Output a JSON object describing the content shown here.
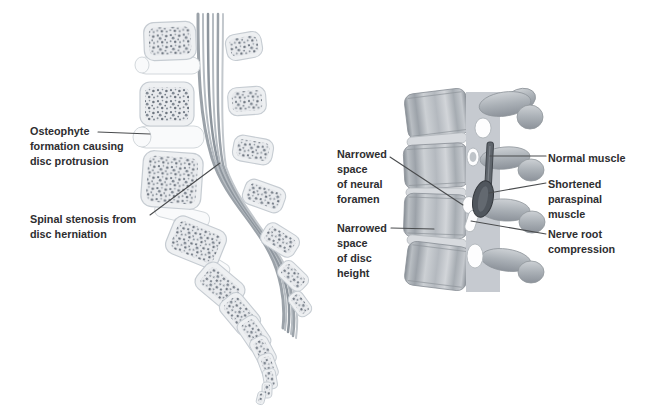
{
  "figure": {
    "labels": {
      "osteophyte": {
        "text": "Osteophyte\nformation causing\ndisc protrusion"
      },
      "stenosis": {
        "text": "Spinal stenosis from\ndisc herniation"
      },
      "neural_foramen": {
        "text": "Narrowed\nspace\nof neural\nforamen"
      },
      "disc_height": {
        "text": "Narrowed\nspace\nof disc\nheight"
      },
      "normal_muscle": {
        "text": "Normal muscle"
      },
      "paraspinal": {
        "text": "Shortened\nparaspinal\nmuscle"
      },
      "nerve_root": {
        "text": "Nerve root\ncompression"
      }
    },
    "illustrations": {
      "left": "sagittal-lumbar-spine-section",
      "right": "lateral-lumbar-spine"
    },
    "palette": {
      "background": "#ffffff",
      "text": "#2e2e30",
      "leader_line": "#4a4c4e",
      "bone_fill": "#eef0f2",
      "bone_outline": "#c6ccd2",
      "trabecular_speckle": "#6e7680",
      "disc_white": "#f9fafb",
      "nerve_gray": "#9ba2a9",
      "vertebra_gray": "#b4b9bf",
      "process_gray": "#aab0b6",
      "muscle_dark": "#50565d",
      "foramen_white": "#fdfdfe"
    }
  }
}
